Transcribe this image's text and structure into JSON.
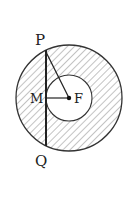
{
  "diagram": {
    "labels": {
      "P": "P",
      "Q": "Q",
      "M": "M",
      "F": "F"
    },
    "colors": {
      "stroke": "#333333",
      "hatch": "#888888",
      "background": "#ffffff"
    }
  }
}
